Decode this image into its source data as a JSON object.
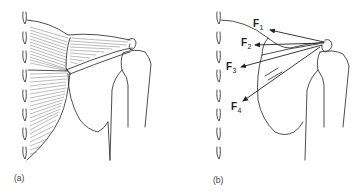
{
  "figure": {
    "panels": [
      {
        "id": "a",
        "label": "(a)",
        "content": "Trapezius muscle fibers spanning from spine to scapula/clavicle, with humerus"
      },
      {
        "id": "b",
        "label": "(b)",
        "content": "Force vectors from acromion toward spine"
      }
    ],
    "forces": [
      {
        "name": "F",
        "sub": "1"
      },
      {
        "name": "F",
        "sub": "2"
      },
      {
        "name": "F",
        "sub": "3"
      },
      {
        "name": "F",
        "sub": "4"
      }
    ],
    "colors": {
      "line": "#3a3a3a",
      "fiber": "#6a6a6a",
      "text": "#222222",
      "background": "#ffffff"
    }
  }
}
